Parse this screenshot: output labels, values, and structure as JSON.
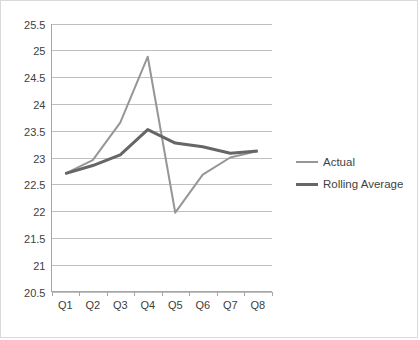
{
  "chart_data": {
    "type": "line",
    "title": "",
    "xlabel": "",
    "ylabel": "",
    "categories": [
      "Q1",
      "Q2",
      "Q3",
      "Q4",
      "Q5",
      "Q6",
      "Q7",
      "Q8"
    ],
    "ylim": [
      20.5,
      25.5
    ],
    "ytick_step": 0.5,
    "ytick_labels": [
      "25.5",
      "25",
      "24.5",
      "24",
      "23.5",
      "23",
      "22.5",
      "22",
      "21.5",
      "21",
      "20.5"
    ],
    "ytick_values": [
      25.5,
      25,
      24.5,
      24,
      23.5,
      23,
      22.5,
      22,
      21.5,
      21,
      20.5
    ],
    "grid": "horizontal",
    "legend_position": "right",
    "series": [
      {
        "name": "Actual",
        "color": "#969696",
        "width": 2.0,
        "values": [
          22.7,
          22.95,
          23.65,
          24.88,
          21.97,
          22.68,
          23.0,
          23.12
        ]
      },
      {
        "name": "Rolling Average",
        "color": "#666666",
        "width": 3.0,
        "values": [
          22.7,
          22.85,
          23.05,
          23.52,
          23.27,
          23.2,
          23.08,
          23.12
        ]
      }
    ]
  },
  "legend": {
    "items": [
      {
        "label": "Actual"
      },
      {
        "label": "Rolling Average"
      }
    ]
  },
  "colors": {
    "actual": "#969696",
    "rolling_average": "#666666",
    "gridline": "#bfbfbf",
    "axis": "#a6a6a6",
    "border": "#d9d9d9",
    "text": "#404040",
    "background": "#ffffff"
  }
}
